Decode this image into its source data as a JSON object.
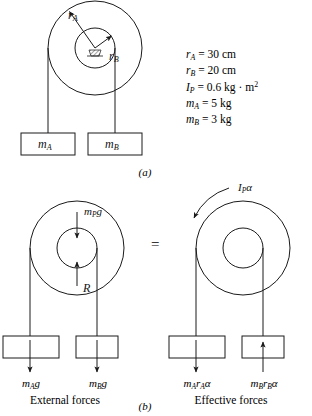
{
  "figure": {
    "title_a": "(a)",
    "title_b": "(b)",
    "equals": "="
  },
  "given_values": [
    {
      "id": "rA",
      "symbol": "r",
      "sub": "A",
      "rest": " = 30 cm"
    },
    {
      "id": "rB",
      "symbol": "r",
      "sub": "B",
      "rest": " = 20 cm"
    },
    {
      "id": "IP",
      "symbol": "I",
      "sub": "P",
      "rest": " = 0.6 kg · m",
      "sup": "2"
    },
    {
      "id": "mA",
      "symbol": "m",
      "sub": "A",
      "rest": " = 5 kg"
    },
    {
      "id": "mB",
      "symbol": "m",
      "sub": "B",
      "rest": " = 3 kg"
    }
  ],
  "part_a": {
    "radius_label_outer": {
      "symbol": "r",
      "sub": "A"
    },
    "radius_label_inner": {
      "symbol": "r",
      "sub": "B"
    },
    "block_left": {
      "symbol": "m",
      "sub": "A"
    },
    "block_right": {
      "symbol": "m",
      "sub": "B"
    }
  },
  "part_b": {
    "left_caption": "External forces",
    "right_caption": "Effective forces",
    "pulley_weight": {
      "symbol": "m",
      "sub": "P",
      "rest": "g"
    },
    "reaction": {
      "symbol": "R"
    },
    "torque": {
      "symbol": "I",
      "sub": "P",
      "rest": "α"
    },
    "force_left_1": {
      "symbol": "m",
      "sub": "A",
      "rest": "g"
    },
    "force_left_2": {
      "symbol": "m",
      "sub": "B",
      "rest": "g"
    },
    "force_right_1": {
      "symbol": "m",
      "sub": "A",
      "sym2": "r",
      "sub2": "A",
      "rest": "α"
    },
    "force_right_2": {
      "symbol": "m",
      "sub": "B",
      "sym2": "r",
      "sub2": "B",
      "rest": "α"
    }
  },
  "colors": {
    "stroke": "#1a1a1a",
    "text": "#111111",
    "background": "#ffffff"
  }
}
